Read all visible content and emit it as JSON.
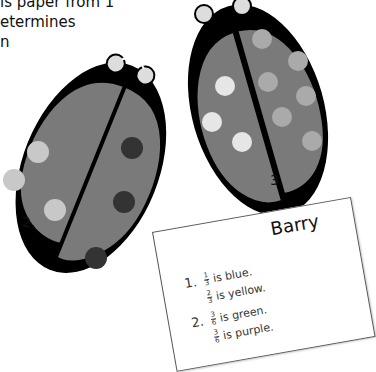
{
  "intro_text": {
    "lines": [
      "",
      "is paper from 1",
      "etermines",
      "n"
    ]
  },
  "ladybugs": [
    {
      "label": "2.",
      "left_wing_dots": 3,
      "left_dot_color": "#c8c8c8",
      "right_wing_dots": 3,
      "right_dot_color": "#333333"
    },
    {
      "label": "3.",
      "left_wing_dots": 3,
      "left_dot_color": "#e6e6e6",
      "right_wing_dots": 6,
      "right_dot_color": "#aaaaaa"
    }
  ],
  "colors": {
    "wing": "#7a7a7a",
    "body": "#000000"
  },
  "card": {
    "name": "Barry",
    "items": [
      {
        "number": "1.",
        "lines": [
          {
            "num": "1",
            "den": "3",
            "text": "is blue."
          },
          {
            "num": "2",
            "den": "3",
            "text": "is yellow."
          }
        ]
      },
      {
        "number": "2.",
        "lines": [
          {
            "num": "3",
            "den": "6",
            "text": "is green."
          },
          {
            "num": "3",
            "den": "6",
            "text": "is purple."
          }
        ]
      }
    ]
  }
}
